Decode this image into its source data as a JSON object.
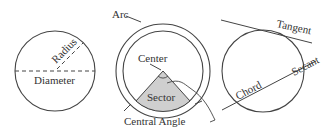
{
  "figure": {
    "stroke_color": "#444444",
    "sector_fill": "#cfcfcf",
    "panels": [
      {
        "name": "radius-diameter",
        "labels": {
          "radius": "Radius",
          "diameter": "Diameter"
        }
      },
      {
        "name": "arc-sector",
        "labels": {
          "arc": "Arc",
          "center": "Center",
          "sector": "Sector",
          "central_angle": "Central Angle"
        }
      },
      {
        "name": "tangent-secant-chord",
        "labels": {
          "tangent": "Tangent",
          "secant": "Secant",
          "chord": "Chord"
        }
      }
    ]
  }
}
